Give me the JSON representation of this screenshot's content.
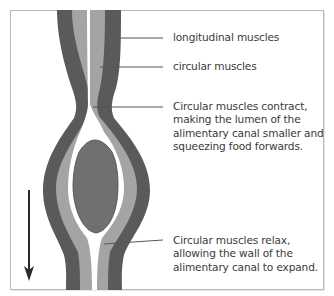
{
  "diagram": {
    "colors": {
      "outer_layer": "#5a5a5a",
      "inner_layer": "#a4a4a4",
      "lumen": "#ffffff",
      "food_bolus": "#707070",
      "leader_lines": "#555555",
      "arrow": "#2a2a2a",
      "frame": "#b8b8b8",
      "text": "#3a3a3a"
    },
    "labels": {
      "longitudinal": "longitudinal muscles",
      "circular": "circular muscles",
      "contract": {
        "line1": "Circular muscles contract,",
        "line2": "making the lumen of the",
        "line3": "alimentary canal smaller and",
        "line4": "squeezing food forwards."
      },
      "relax": {
        "line1": "Circular muscles relax,",
        "line2": "allowing the wall of the",
        "line3": "alimentary canal to expand."
      }
    },
    "arrow": {
      "direction": "down",
      "meaning": "direction of food movement"
    }
  }
}
